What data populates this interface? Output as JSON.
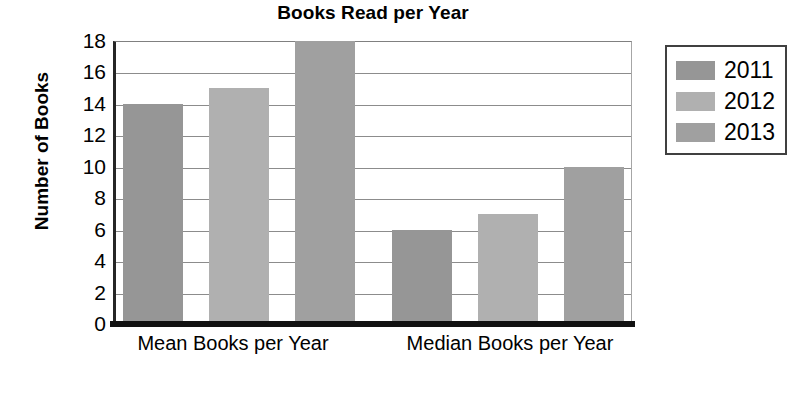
{
  "chart_data": {
    "type": "bar",
    "title": "Books Read per Year",
    "xlabel": "",
    "ylabel": "Number of Books",
    "categories": [
      "Mean Books per Year",
      "Median Books per Year"
    ],
    "series": [
      {
        "name": "2011",
        "values": [
          14,
          6
        ],
        "color": "#969696"
      },
      {
        "name": "2012",
        "values": [
          15,
          7
        ],
        "color": "#b0b0b0"
      },
      {
        "name": "2013",
        "values": [
          18,
          10
        ],
        "color": "#a0a0a0"
      }
    ],
    "ylim": [
      0,
      18
    ],
    "yticks": [
      0,
      2,
      4,
      6,
      8,
      10,
      12,
      14,
      16,
      18
    ],
    "ytick_labels": [
      "0",
      "2",
      "4",
      "6",
      "8",
      "10",
      "12",
      "14",
      "16",
      "18"
    ],
    "grid": "horizontal",
    "legend_position": "right",
    "legend_entries": [
      "2011",
      "2012",
      "2013"
    ],
    "axis_color": "#111111",
    "gridline_color": "#8c8c8c",
    "background": "#ffffff"
  }
}
